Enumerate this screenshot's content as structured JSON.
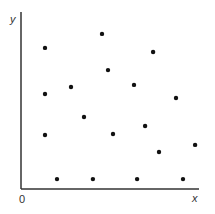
{
  "chart_data": {
    "type": "scatter",
    "title": "",
    "xlabel": "x",
    "ylabel": "y",
    "origin_label": "0",
    "xlim": [
      0,
      100
    ],
    "ylim": [
      0,
      100
    ],
    "grid": false,
    "legend": null,
    "marker_color": "#111111",
    "axis_color": "#333333",
    "series": [
      {
        "name": "points",
        "points": [
          {
            "x": 13.5,
            "y": 79.7
          },
          {
            "x": 45.5,
            "y": 87.6
          },
          {
            "x": 48.9,
            "y": 67.2
          },
          {
            "x": 74.2,
            "y": 77.4
          },
          {
            "x": 13.5,
            "y": 53.7
          },
          {
            "x": 28.1,
            "y": 57.6
          },
          {
            "x": 63.5,
            "y": 58.8
          },
          {
            "x": 87.1,
            "y": 51.4
          },
          {
            "x": 35.4,
            "y": 40.7
          },
          {
            "x": 13.5,
            "y": 30.5
          },
          {
            "x": 51.7,
            "y": 31.1
          },
          {
            "x": 69.7,
            "y": 35.6
          },
          {
            "x": 77.5,
            "y": 20.9
          },
          {
            "x": 97.8,
            "y": 24.9
          },
          {
            "x": 20.2,
            "y": 5.6
          },
          {
            "x": 40.4,
            "y": 5.6
          },
          {
            "x": 65.2,
            "y": 5.6
          },
          {
            "x": 91.0,
            "y": 5.6
          }
        ]
      }
    ]
  }
}
